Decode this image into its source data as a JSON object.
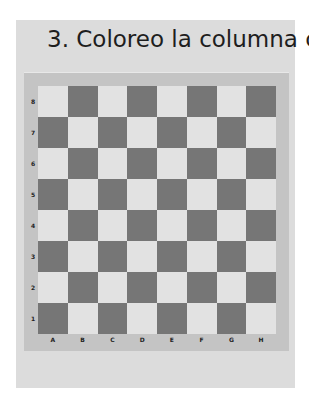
{
  "title": "3. Coloreo la columna c",
  "board": {
    "ranks": [
      "8",
      "7",
      "6",
      "5",
      "4",
      "3",
      "2",
      "1"
    ],
    "files": [
      "A",
      "B",
      "C",
      "D",
      "E",
      "F",
      "G",
      "H"
    ],
    "colors": {
      "light": "#e2e2e2",
      "dark": "#767676",
      "frame": "#c4c4c4",
      "panel": "#dcdcdc"
    }
  }
}
